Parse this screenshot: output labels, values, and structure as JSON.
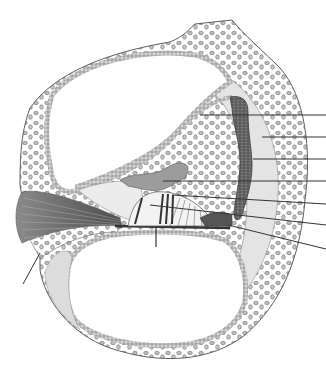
{
  "diagram": {
    "background": "#ffffff",
    "colors": {
      "outline": "#555555",
      "bone_fill": "#ffffff",
      "bone_cell": "#8a8a8a",
      "membrane_cell": "#6f6f6f",
      "ligament": "#e2e2e2",
      "stria": "#4a4a4a",
      "tectorial": "#9a9a9a",
      "nerve": "#6a6a6a",
      "leader": "#333333"
    },
    "leader_lines": [
      {
        "x1": 200,
        "y1": 115,
        "x2": 326,
        "y2": 115
      },
      {
        "x1": 262,
        "y1": 137,
        "x2": 326,
        "y2": 137
      },
      {
        "x1": 253,
        "y1": 159,
        "x2": 326,
        "y2": 159
      },
      {
        "x1": 163,
        "y1": 181,
        "x2": 326,
        "y2": 181
      },
      {
        "x1": 172,
        "y1": 195,
        "x2": 326,
        "y2": 204
      },
      {
        "x1": 150,
        "y1": 205,
        "x2": 326,
        "y2": 225
      },
      {
        "x1": 228,
        "y1": 225,
        "x2": 326,
        "y2": 249
      },
      {
        "x1": 40,
        "y1": 253,
        "x2": 23,
        "y2": 284
      }
    ],
    "labels": []
  }
}
